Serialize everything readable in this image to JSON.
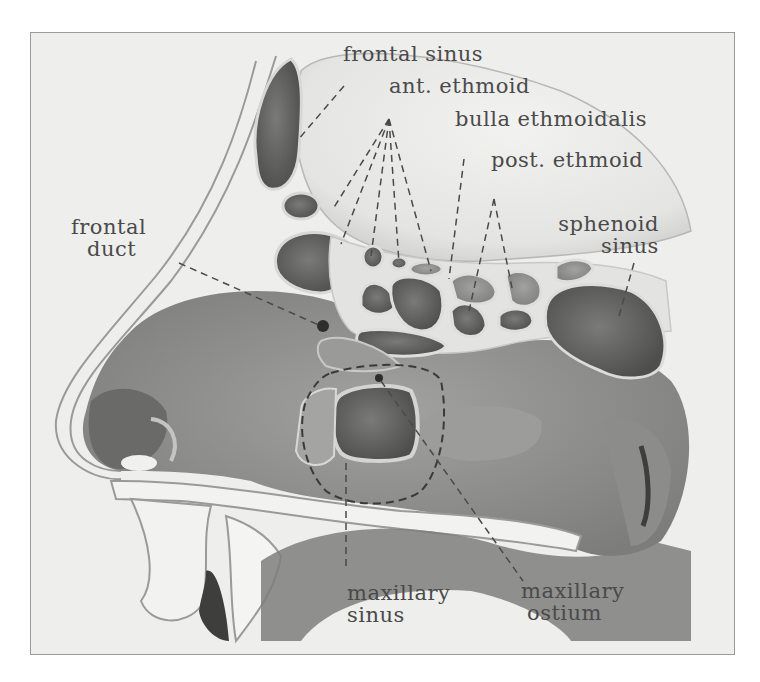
{
  "figure": {
    "palette": {
      "paper": "#eeeeec",
      "bone": "#e6e6e3",
      "mucosa_light": "#a8a8a6",
      "mucosa_mid": "#8a8a88",
      "mucosa_dark": "#5e5e5c",
      "ink": "#4a4a4a"
    }
  },
  "labels": {
    "frontal_sinus": {
      "line1": "frontal sinus"
    },
    "ant_ethmoid": {
      "line1": "ant. ethmoid"
    },
    "bulla_ethmoidalis": {
      "line1": "bulla ethmoidalis"
    },
    "post_ethmoid": {
      "line1": "post. ethmoid"
    },
    "sphenoid_sinus": {
      "line1": "sphenoid",
      "line2": "sinus"
    },
    "frontal_duct": {
      "line1": "frontal",
      "line2": "duct"
    },
    "maxillary_sinus": {
      "line1": "maxillary",
      "line2": "sinus"
    },
    "maxillary_ostium": {
      "line1": "maxillary",
      "line2": "ostium"
    }
  }
}
